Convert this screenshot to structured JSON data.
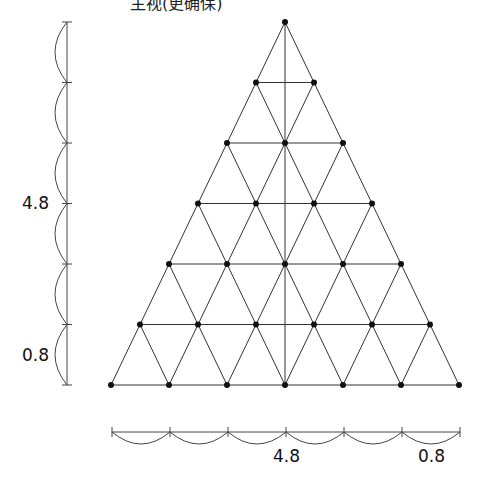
{
  "title": "主视(更确保)",
  "labels": {
    "left_upper": "4.8",
    "left_lower": "0.8",
    "bottom_mid": "4.8",
    "bottom_right": "0.8"
  },
  "diagram": {
    "type": "triangular-grid-with-dimension-lines",
    "rows": 7,
    "apex": [
      285,
      22
    ],
    "base_left": [
      112,
      385
    ],
    "base_right": [
      460,
      385
    ],
    "row_count_segments": 6,
    "left_dimension": {
      "x": 67,
      "y_top": 22,
      "y_bottom": 385,
      "segments": 6
    },
    "bottom_dimension": {
      "y": 432,
      "x_left": 112,
      "x_right": 460,
      "segments": 6
    },
    "line_color": "#333333",
    "node_color": "#111111"
  }
}
